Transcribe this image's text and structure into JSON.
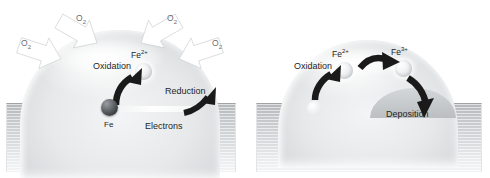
{
  "figure": {
    "panel_count": 2,
    "background_color": "#ffffff"
  },
  "colors": {
    "substrate": "#c8cbcd",
    "droplet": "#e7e9ea",
    "arrow_white": "#ffffff",
    "arrow_dark": "#1a1a1a",
    "text": "#1f1f1f",
    "o2_text": "#6a6e72",
    "iron_atom": "#3e4246"
  },
  "left_panel": {
    "name": "oxidation-and-reduction-panel",
    "o2_labels": [
      {
        "text": "O",
        "sub": "2",
        "name": "o2-label-top-left"
      },
      {
        "text": "O",
        "sub": "2",
        "name": "o2-label-top-right"
      },
      {
        "text": "O",
        "sub": "2",
        "name": "o2-label-left"
      },
      {
        "text": "O",
        "sub": "2",
        "name": "o2-label-right"
      }
    ],
    "oxidation_label": "Oxidation",
    "ion_label": {
      "element": "Fe",
      "charge": "2+"
    },
    "reduction_label": "Reduction",
    "iron_atom_label": "Fe",
    "electrons_label": "Electrons",
    "o2_arrow_count": 4
  },
  "right_panel": {
    "name": "further-oxidation-and-deposition-panel",
    "oxidation_label": "Oxidation",
    "ion_labels": [
      {
        "element": "Fe",
        "charge": "2+",
        "name": "fe2-ion-label"
      },
      {
        "element": "Fe",
        "charge": "3+",
        "name": "fe3-ion-label"
      }
    ],
    "deposition_label": "Deposition",
    "dark_arrow_count": 3
  }
}
